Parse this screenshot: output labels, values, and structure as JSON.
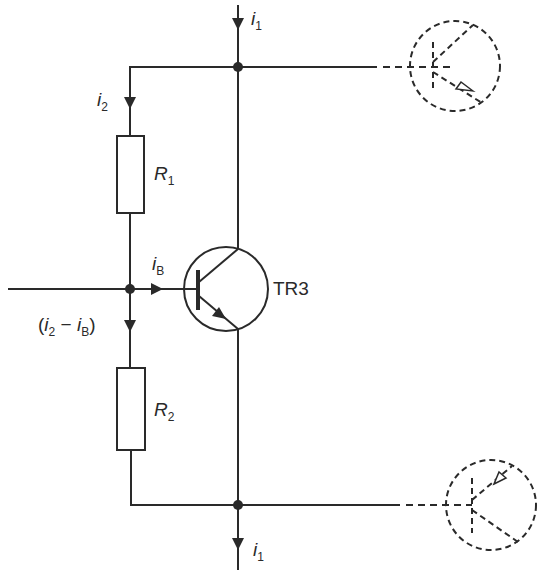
{
  "diagram": {
    "type": "circuit-schematic",
    "stroke_color": "#2a2a2a",
    "background": "#ffffff",
    "components": {
      "transistor": {
        "name": "TR3",
        "type": "NPN bipolar transistor"
      },
      "resistors": [
        {
          "name": "R",
          "subscript": "1"
        },
        {
          "name": "R",
          "subscript": "2"
        }
      ],
      "ghost_transistors": [
        {
          "position": "top-right",
          "style": "dashed",
          "type": "PNP"
        },
        {
          "position": "bottom-right",
          "style": "dashed",
          "type": "PNP"
        }
      ]
    },
    "currents": {
      "i1_top": {
        "base": "i",
        "subscript": "1"
      },
      "i1_bottom": {
        "base": "i",
        "subscript": "1"
      },
      "i2": {
        "base": "i",
        "subscript": "2"
      },
      "iB": {
        "base": "i",
        "subscript": "B"
      },
      "diff": {
        "open": "(",
        "a_base": "i",
        "a_sub": "2",
        "op": " − ",
        "b_base": "i",
        "b_sub": "B",
        "close": ")"
      }
    }
  }
}
